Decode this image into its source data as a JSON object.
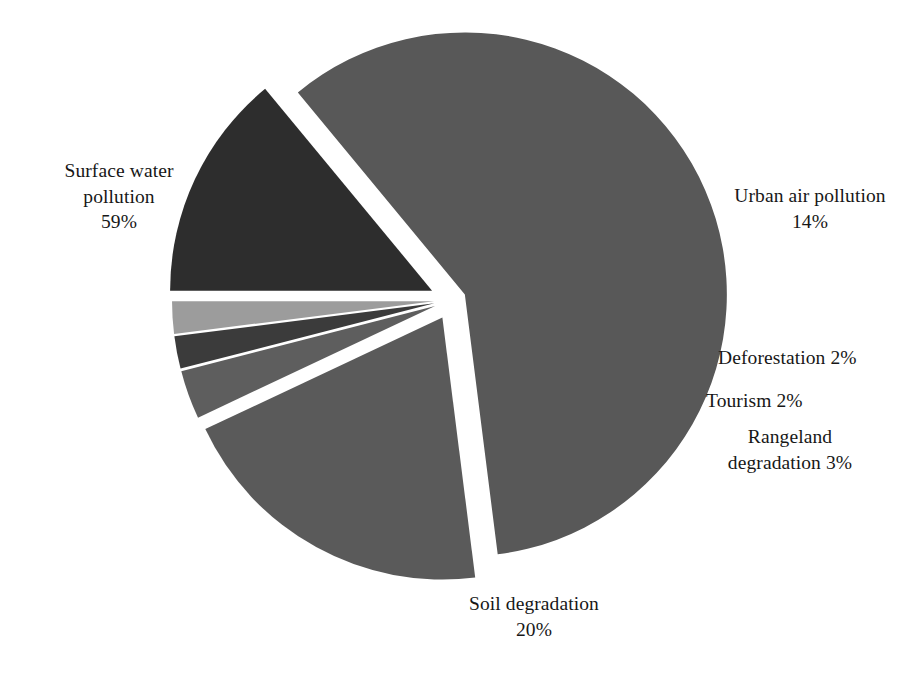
{
  "chart_data": {
    "type": "pie",
    "title": "",
    "subtitle": "",
    "xlabel": "",
    "ylabel": "",
    "legend_position": "none",
    "grid": false,
    "units": "percent",
    "total": 100,
    "exploded": true,
    "categories": [
      "Surface water pollution",
      "Urban air pollution",
      "Deforestation",
      "Tourism",
      "Rangeland degradation",
      "Soil degradation"
    ],
    "values": [
      59,
      14,
      2,
      2,
      3,
      20
    ],
    "labels": [
      "Surface water\npollution\n59%",
      "Urban air pollution\n14%",
      "Deforestation 2%",
      "Tourism 2%",
      "Rangeland\ndegradation 3%",
      "Soil degradation\n20%"
    ],
    "slices": [
      {
        "name": "Surface water pollution",
        "value": 59,
        "value_text": "59%",
        "label_text": "Surface water\npollution\n59%",
        "color": "#585858",
        "start_angle_deg": 320.4,
        "end_angle_deg": 532.8,
        "explode": 14
      },
      {
        "name": "Urban air pollution",
        "value": 14,
        "value_text": "14%",
        "label_text": "Urban air pollution\n14%",
        "color": "#2d2d2d",
        "start_angle_deg": 270.0,
        "end_angle_deg": 320.4,
        "explode": 22
      },
      {
        "name": "Deforestation",
        "value": 2,
        "value_text": "2%",
        "label_text": "Deforestation 2%",
        "color": "#9c9c9c",
        "start_angle_deg": 262.8,
        "end_angle_deg": 270.0,
        "explode": 18
      },
      {
        "name": "Tourism",
        "value": 2,
        "value_text": "2%",
        "label_text": "Tourism 2%",
        "color": "#3b3b3b",
        "start_angle_deg": 255.6,
        "end_angle_deg": 262.8,
        "explode": 18
      },
      {
        "name": "Rangeland degradation",
        "value": 3,
        "value_text": "3%",
        "label_text": "Rangeland\ndegradation 3%",
        "color": "#5e5e5e",
        "start_angle_deg": 244.8,
        "end_angle_deg": 255.6,
        "explode": 18
      },
      {
        "name": "Soil degradation",
        "value": 20,
        "value_text": "20%",
        "label_text": "Soil degradation\n20%",
        "color": "#5a5a5a",
        "start_angle_deg": 172.8,
        "end_angle_deg": 244.8,
        "explode": 20
      }
    ],
    "geometry": {
      "center_x": 452,
      "center_y": 300,
      "radius": 262,
      "rotation_deg": 0
    },
    "background_color": "#ffffff"
  },
  "labels_layout": [
    {
      "key": "surface-water-pollution",
      "text": "Surface water\npollution\n59%",
      "left": 28,
      "top": 158,
      "width": 182,
      "align": "center"
    },
    {
      "key": "urban-air-pollution",
      "text": "Urban air pollution\n14%",
      "left": 712,
      "top": 183,
      "width": 196,
      "align": "center"
    },
    {
      "key": "deforestation",
      "text": "Deforestation 2%",
      "left": 718,
      "top": 345,
      "width": 190,
      "align": "left"
    },
    {
      "key": "tourism",
      "text": "Tourism 2%",
      "left": 706,
      "top": 388,
      "width": 190,
      "align": "left"
    },
    {
      "key": "rangeland-degradation",
      "text": "Rangeland\ndegradation 3%",
      "left": 686,
      "top": 424,
      "width": 208,
      "align": "center"
    },
    {
      "key": "soil-degradation",
      "text": "Soil degradation\n20%",
      "left": 428,
      "top": 591,
      "width": 212,
      "align": "center"
    }
  ]
}
